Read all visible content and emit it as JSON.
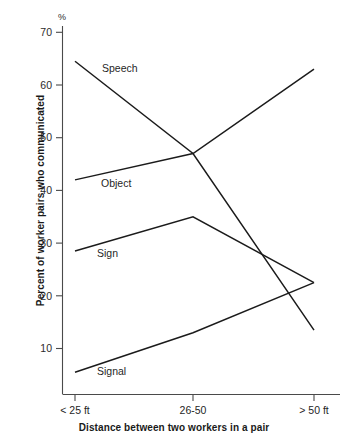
{
  "chart_data": {
    "type": "line",
    "title": "",
    "subtitle": "",
    "xlabel": "Distance between two workers in a pair",
    "ylabel": "Percent of worker pairs who communicated",
    "y_unit": "%",
    "categories": [
      "< 25 ft",
      "26-50",
      "> 50 ft"
    ],
    "ylim": [
      0,
      72
    ],
    "yticks": [
      10,
      20,
      30,
      40,
      50,
      60,
      70
    ],
    "ytick_labels": [
      "10",
      "20",
      "30",
      "40",
      "50",
      "60",
      "70"
    ],
    "grid": false,
    "legend": "inline-labels",
    "series": [
      {
        "name": "Speech",
        "values": [
          64.5,
          47.0,
          13.5
        ],
        "label_x": "< 25 ft",
        "color": "#1b1b1b"
      },
      {
        "name": "Object",
        "values": [
          42.0,
          47.0,
          63.0
        ],
        "label_x": "< 25 ft",
        "color": "#1b1b1b"
      },
      {
        "name": "Sign",
        "values": [
          28.5,
          35.0,
          22.5
        ],
        "label_x": "< 25 ft",
        "color": "#1b1b1b"
      },
      {
        "name": "Signal",
        "values": [
          5.5,
          13.0,
          22.5
        ],
        "label_x": "< 25 ft",
        "color": "#1b1b1b"
      }
    ],
    "annotations": [
      {
        "text": "Speech",
        "x_px": 102,
        "y_px": 72
      },
      {
        "text": "Object",
        "x_px": 101,
        "y_px": 187
      },
      {
        "text": "Sign",
        "x_px": 97,
        "y_px": 257
      },
      {
        "text": "Signal",
        "x_px": 97,
        "y_px": 375
      }
    ]
  },
  "axis": {
    "unit_label": "%",
    "x_categories": [
      "< 25 ft",
      "26-50",
      "> 50 ft"
    ],
    "y_ticks": [
      "70",
      "60",
      "50",
      "40",
      "30",
      "20",
      "10"
    ]
  }
}
